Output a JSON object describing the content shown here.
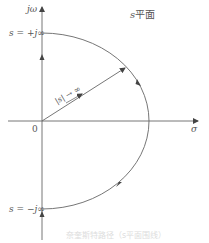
{
  "diagram": {
    "title_var": "s",
    "title_suffix": "平面",
    "labels": {
      "imag_axis": "jω",
      "real_axis": "σ",
      "origin": "0",
      "top_point": "s = +j∞",
      "bottom_point": "s = −j∞",
      "radius": "|s| → ∞"
    },
    "caption": "奈奎斯特路径（s平面围线）",
    "colors": {
      "line": "#555555",
      "text": "#555555",
      "background": "#ffffff"
    }
  }
}
